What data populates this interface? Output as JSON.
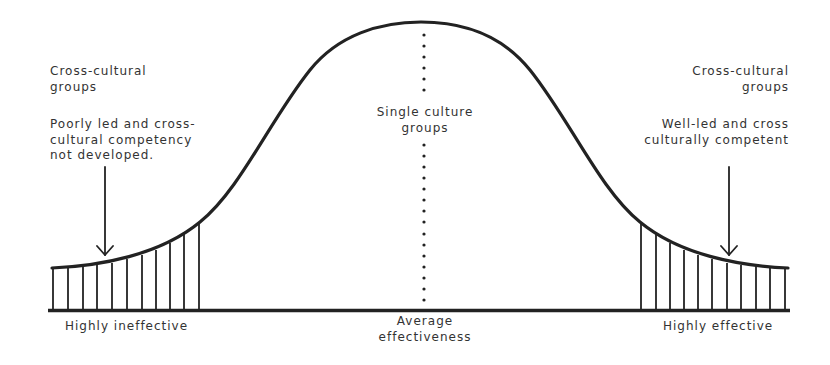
{
  "diagram": {
    "type": "bell-curve",
    "colors": {
      "line": "#222222",
      "text": "#333333",
      "background": "#ffffff"
    },
    "left": {
      "group_title": [
        "Cross-cultural",
        "groups"
      ],
      "description": [
        "Poorly led and cross-",
        "cultural competency",
        "not developed."
      ],
      "axis_label": "Highly ineffective",
      "arrow_icon": "down-arrow"
    },
    "center": {
      "group_title": [
        "Single culture",
        "groups"
      ],
      "axis_label": [
        "Average",
        "effectiveness"
      ]
    },
    "right": {
      "group_title": [
        "Cross-cultural",
        "groups"
      ],
      "description": [
        "Well-led and cross",
        "culturally competent"
      ],
      "axis_label": "Highly effective",
      "arrow_icon": "down-arrow"
    }
  }
}
